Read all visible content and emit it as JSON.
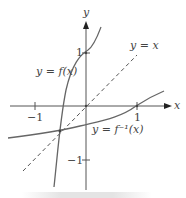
{
  "diagram": {
    "axes": {
      "x_label": "x",
      "y_label": "y",
      "ticks": {
        "x_neg": "−1",
        "x_pos": "1",
        "y_pos": "1",
        "y_neg": "−1"
      }
    },
    "curves": {
      "f_label": "y = f(x)",
      "f_inverse_label": "y = f⁻¹(x)",
      "identity_label": "y = x"
    },
    "colors": {
      "axis": "#555555",
      "curve": "#666666",
      "dashed": "#555555",
      "text": "#444444"
    }
  }
}
